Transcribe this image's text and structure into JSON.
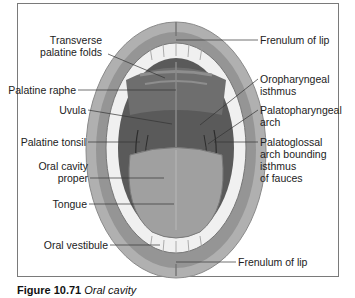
{
  "figure": {
    "caption_number": "Figure 10.71",
    "caption_title": "Oral cavity"
  },
  "labels": {
    "transverse_palatine_folds_1": "Transverse",
    "transverse_palatine_folds_2": "palatine folds",
    "frenulum_upper": "Frenulum of lip",
    "palatine_raphe": "Palatine raphe",
    "oropharyngeal_isthmus_1": "Oropharyngeal",
    "oropharyngeal_isthmus_2": "isthmus",
    "uvula": "Uvula",
    "palatopharyngeal_arch_1": "Palatopharyngeal",
    "palatopharyngeal_arch_2": "arch",
    "palatine_tonsil": "Palatine tonsil",
    "palatoglossal_1": "Palatoglossal",
    "palatoglossal_2": "arch bounding",
    "palatoglossal_3": "isthmus",
    "palatoglossal_4": "of fauces",
    "oral_cavity_proper_1": "Oral cavity",
    "oral_cavity_proper_2": "proper",
    "tongue": "Tongue",
    "oral_vestibule": "Oral vestibule",
    "frenulum_lower": "Frenulum of lip"
  },
  "colors": {
    "lip": "#a9a9a9",
    "lip_inner": "#8c8c8c",
    "cavity": "#5e5e5e",
    "palate": "#777777",
    "tongue": "#9a9a9a",
    "teeth": "#f2f2f2",
    "leader": "#333333"
  }
}
